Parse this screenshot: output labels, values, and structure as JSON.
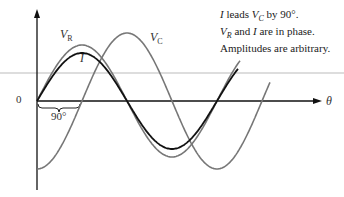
{
  "annotations": {
    "line1": {
      "pre": "I",
      "mid": " leads ",
      "v": "V",
      "vsub": "C",
      "post": " by 90°."
    },
    "line2": {
      "v": "V",
      "vsub": "R",
      "mid": " and ",
      "i": "I",
      "post": " are in phase."
    },
    "line3": "Amplitudes are arbitrary."
  },
  "labels": {
    "vr": {
      "main": "V",
      "sub": "R"
    },
    "vc": {
      "main": "V",
      "sub": "C"
    },
    "i": "I",
    "origin": "0",
    "theta": "θ",
    "phase": "90°"
  },
  "colors": {
    "current": "#111111",
    "vr": "#777777",
    "vc": "#777777",
    "axis": "#111111",
    "rule": "#bbbbbb"
  },
  "curves": [
    {
      "name": "I",
      "amplitude": 48,
      "phase_deg": 0
    },
    {
      "name": "V_R",
      "amplitude": 56,
      "phase_deg": 0
    },
    {
      "name": "V_C",
      "amplitude": 68,
      "phase_deg": -90
    }
  ]
}
